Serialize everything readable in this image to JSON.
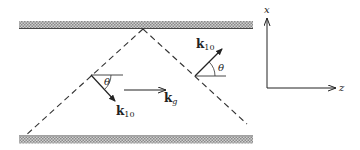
{
  "diagram": {
    "plates": {
      "top_label": "",
      "bottom_label": ""
    },
    "vectors": {
      "k_up": {
        "symbol": "k",
        "subscript": "10"
      },
      "k_down": {
        "symbol": "k",
        "subscript": "10"
      },
      "k_guide": {
        "symbol": "k",
        "subscript": "g"
      }
    },
    "angles": {
      "left": "θ",
      "right": "θ"
    },
    "axes": {
      "vertical": "x",
      "horizontal": "z"
    }
  }
}
